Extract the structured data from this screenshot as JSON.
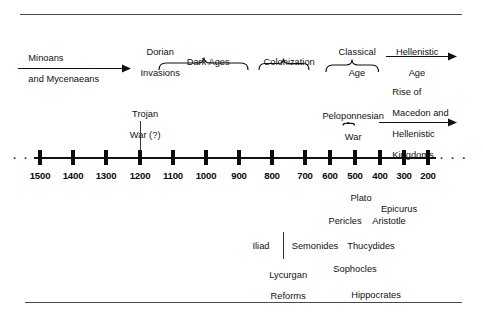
{
  "figure": {
    "kind": "greek-history-timeline",
    "top_rule": true,
    "bottom_rule": true,
    "ellipsis_left": "· · ·",
    "ellipsis_right": "· · ·"
  },
  "axis": {
    "label": "Years BCE",
    "ticks": [
      {
        "year": "1500",
        "x": 40
      },
      {
        "year": "1400",
        "x": 73
      },
      {
        "year": "1300",
        "x": 106
      },
      {
        "year": "1200",
        "x": 140
      },
      {
        "year": "1100",
        "x": 173
      },
      {
        "year": "1000",
        "x": 206
      },
      {
        "year": "900",
        "x": 239
      },
      {
        "year": "800",
        "x": 272
      },
      {
        "year": "700",
        "x": 305
      },
      {
        "year": "600",
        "x": 330
      },
      {
        "year": "500",
        "x": 355
      },
      {
        "year": "400",
        "x": 380
      },
      {
        "year": "300",
        "x": 404
      },
      {
        "year": "200",
        "x": 428
      }
    ]
  },
  "eras": {
    "minoans": {
      "line1": "Minoans",
      "line2": "and Mycenaeans"
    },
    "dorian": {
      "line1": "Dorian",
      "line2": "Invasions"
    },
    "dark_ages": {
      "label": "Dark Ages"
    },
    "colonization": {
      "label": "Colonization"
    },
    "classical": {
      "line1": "Classical",
      "line2": "Age"
    },
    "hellenistic": {
      "line1": "Hellenistic",
      "line2": "Age"
    }
  },
  "events": {
    "trojan": {
      "line1": "Trojan",
      "line2": "War (?)"
    },
    "peloponnesian": {
      "line1": "Peloponnesian",
      "line2": "War"
    },
    "macedon": {
      "line1": "Rise of",
      "line2": "Macedon and",
      "line3": "Hellenistic",
      "line4": "Kingdoms"
    }
  },
  "figures": [
    {
      "name": "Plato",
      "x": 361,
      "y": 193
    },
    {
      "name": "Epicurus",
      "x": 399,
      "y": 204
    },
    {
      "name": "Pericles",
      "x": 345,
      "y": 216
    },
    {
      "name": "Aristotle",
      "x": 389,
      "y": 216
    },
    {
      "name": "Iliad",
      "x": 261,
      "y": 241
    },
    {
      "name": "Semonides",
      "x": 315,
      "y": 241
    },
    {
      "name": "Thucydides",
      "x": 371,
      "y": 241
    },
    {
      "name": "Sophocles",
      "x": 355,
      "y": 264
    },
    {
      "name": "Hippocrates",
      "x": 376,
      "y": 290
    }
  ],
  "lycurgan": {
    "line1": "Lycurgan",
    "line2": "Reforms",
    "x": 283,
    "y": 259
  }
}
